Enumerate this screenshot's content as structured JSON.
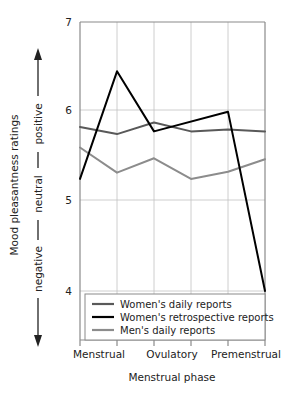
{
  "chart_data": {
    "type": "line",
    "title": "",
    "xlabel": "Menstrual phase",
    "ylabel": "Mood pleasantness ratings",
    "ylabel_scale": "negative — neutral — positive",
    "ylim": [
      4,
      7
    ],
    "yticks": [
      4,
      5,
      6,
      7
    ],
    "ytick_labels": [
      "4",
      "5",
      "6",
      "7"
    ],
    "grid": true,
    "legend_position": "bottom-inside",
    "x_positions": [
      1,
      2,
      3,
      4,
      5,
      6
    ],
    "categories": [
      "Menstrual",
      "",
      "Ovulatory",
      "",
      "Premenstrual",
      ""
    ],
    "xtick_labels": [
      "Menstrual",
      "Ovulatory",
      "Premenstrual"
    ],
    "series": [
      {
        "name": "Women's daily reports",
        "color": "#595959",
        "width": 2.0,
        "x": [
          1,
          2,
          3,
          4,
          5,
          6
        ],
        "values": [
          5.83,
          5.75,
          5.88,
          5.78,
          5.8,
          5.78
        ]
      },
      {
        "name": "Women's retrospective reports",
        "color": "#000000",
        "width": 2.0,
        "x": [
          1,
          2,
          3,
          5,
          6
        ],
        "values": [
          5.25,
          6.45,
          5.78,
          6.0,
          4.0
        ]
      },
      {
        "name": "Men's daily reports",
        "color": "#8c8c8c",
        "width": 2.0,
        "x": [
          1,
          2,
          3,
          4,
          5,
          6
        ],
        "values": [
          5.6,
          5.32,
          5.48,
          5.25,
          5.33,
          5.47
        ]
      }
    ]
  },
  "axes": {
    "y_tick_7": "7",
    "y_tick_6": "6",
    "y_tick_5": "5",
    "y_tick_4": "4",
    "y_axis_title": "Mood pleasantness ratings",
    "y_scale_negative": "negative",
    "y_scale_neutral": "neutral",
    "y_scale_positive": "positive",
    "x_tick_1": "Menstrual",
    "x_tick_2": "Ovulatory",
    "x_tick_3": "Premenstrual",
    "x_axis_title": "Menstrual phase"
  },
  "legend": {
    "items": [
      {
        "label": "Women's daily reports",
        "color": "#595959"
      },
      {
        "label": "Women's retrospective reports",
        "color": "#000000"
      },
      {
        "label": "Men's daily reports",
        "color": "#8c8c8c"
      }
    ]
  },
  "colors": {
    "axis": "#808080",
    "grid": "#bfbfbf",
    "text": "#222222",
    "women_daily": "#595959",
    "women_retrospective": "#000000",
    "men_daily": "#8c8c8c",
    "background": "#ffffff"
  }
}
